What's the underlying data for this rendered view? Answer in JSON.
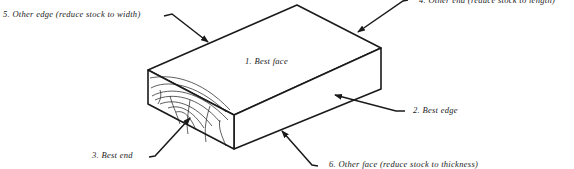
{
  "diagram": {
    "labels": [
      {
        "id": "best-face",
        "text": "1.  Best face"
      },
      {
        "id": "best-edge",
        "text": "2.  Best edge"
      },
      {
        "id": "best-end",
        "text": "3.  Best end"
      },
      {
        "id": "other-end",
        "text": "4.  Other end (reduce stock to length)"
      },
      {
        "id": "other-edge",
        "text": "5.  Other edge (reduce stock to width)"
      },
      {
        "id": "other-face",
        "text": "6.  Other face (reduce stock to thickness)"
      }
    ],
    "colors": {
      "line": "#1a1a1a",
      "background": "#ffffff"
    }
  }
}
